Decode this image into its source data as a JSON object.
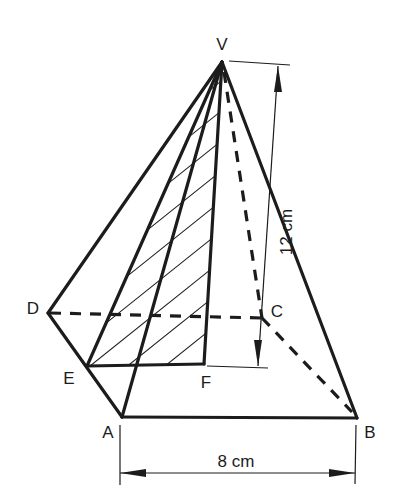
{
  "figure": {
    "type": "square-based pyramid",
    "vertices": {
      "V": "V",
      "A": "A",
      "B": "B",
      "C": "C",
      "D": "D",
      "E": "E",
      "F": "F"
    },
    "dimensions": {
      "height_label": "12 cm",
      "base_label": "8 cm"
    },
    "shaded_region": "triangle VEF (hatched)",
    "colors": {
      "ink": "#1c1c1c",
      "background": "#ffffff"
    }
  }
}
